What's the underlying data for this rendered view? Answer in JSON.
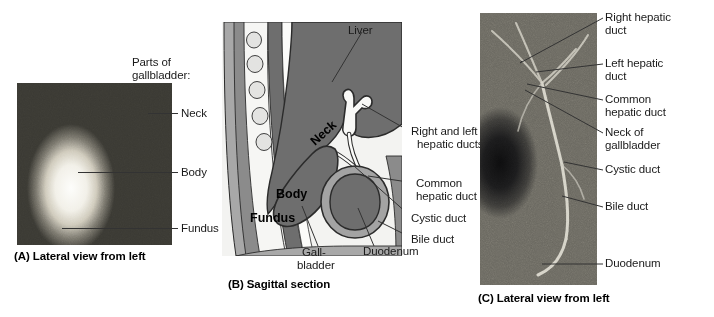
{
  "figure": {
    "background_color": "#ffffff"
  },
  "panel_a": {
    "id": "A",
    "caption": "(A) Lateral view from left",
    "header_line1": "Parts of",
    "header_line2": "gallbladder:",
    "image_type": "radiograph",
    "image_alt": "Cholecystogram radiograph of gallbladder, lateral view from left",
    "labels": [
      {
        "text": "Neck",
        "x": 181,
        "y": 107
      },
      {
        "text": "Body",
        "x": 181,
        "y": 166
      },
      {
        "text": "Fundus",
        "x": 181,
        "y": 222
      }
    ]
  },
  "panel_b": {
    "id": "B",
    "caption": "(B) Sagittal section",
    "image_type": "line-drawing",
    "image_alt": "Sagittal section diagram of liver, gallbladder, bile ducts and duodenum",
    "inner_labels": [
      {
        "text": "Neck",
        "rotated": true
      },
      {
        "text": "Body",
        "rotated": false
      },
      {
        "text": "Fundus",
        "rotated": false
      }
    ],
    "labels": [
      {
        "text": "Liver",
        "x": 348,
        "y": 24
      },
      {
        "text": "Right and left",
        "x": 411,
        "y": 125
      },
      {
        "text": "hepatic ducts",
        "x": 417,
        "y": 138
      },
      {
        "text": "Common",
        "x": 416,
        "y": 177
      },
      {
        "text": "hepatic duct",
        "x": 416,
        "y": 190
      },
      {
        "text": "Cystic duct",
        "x": 411,
        "y": 212
      },
      {
        "text": "Bile duct",
        "x": 411,
        "y": 233
      },
      {
        "text": "Gall-",
        "x": 302,
        "y": 246
      },
      {
        "text": "bladder",
        "x": 297,
        "y": 259
      },
      {
        "text": "Duodenum",
        "x": 363,
        "y": 245
      }
    ],
    "colors": {
      "liver": "#6e6e6e",
      "organ_outline": "#2b2b2b",
      "gallbladder_fill": "#6e6e6e",
      "duodenum_wall": "#9a9a9a",
      "duodenum_lumen": "#6e6e6e",
      "body_wall": "#8f8f8f",
      "vertebra": "#d8d8d8",
      "background": "#f2f2f2"
    }
  },
  "panel_c": {
    "id": "C",
    "caption": "(C) Lateral view from left",
    "image_type": "radiograph",
    "image_alt": "Cholangiogram radiograph showing biliary duct tree, lateral view from left",
    "labels": [
      {
        "text": "Right hepatic",
        "x": 605,
        "y": 11
      },
      {
        "text": "duct",
        "x": 605,
        "y": 24
      },
      {
        "text": "Left hepatic",
        "x": 605,
        "y": 57
      },
      {
        "text": "duct",
        "x": 605,
        "y": 70
      },
      {
        "text": "Common",
        "x": 605,
        "y": 93
      },
      {
        "text": "hepatic duct",
        "x": 605,
        "y": 106
      },
      {
        "text": "Neck of",
        "x": 605,
        "y": 126
      },
      {
        "text": "gallbladder",
        "x": 605,
        "y": 139
      },
      {
        "text": "Cystic duct",
        "x": 605,
        "y": 163
      },
      {
        "text": "Bile duct",
        "x": 605,
        "y": 200
      },
      {
        "text": "Duodenum",
        "x": 605,
        "y": 257
      }
    ]
  }
}
